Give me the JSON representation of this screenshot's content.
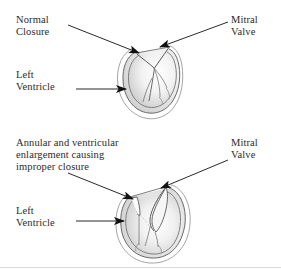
{
  "figure": {
    "width": 281,
    "height": 276,
    "background_color": "#ffffff",
    "ink_color": "#2b2b2b",
    "outline_color": "#555555",
    "shading_color": "#d9d9d9",
    "rule_color": "#d8d8d8"
  },
  "panels": {
    "normal": {
      "name": "normal-closure-panel",
      "labels": {
        "closure": "Normal\nClosure",
        "mitral_valve": "Mitral\nValve",
        "left_ventricle": "Left\nVentricle"
      },
      "annotations": {
        "closure_arrow": "arrow-pointing-down-right-to-valve",
        "mitral_valve_arrow": "arrow-pointing-down-left-to-valve",
        "left_ventricle_arrow": "arrow-pointing-right-to-ventricle-wall"
      },
      "anatomy": {
        "ventricle_shape": "narrow-oval-left-ventricle",
        "valve_state": "leaflets-coapted-closed",
        "chordae": "chordae-tendineae-strands"
      }
    },
    "regurgitant": {
      "name": "improper-closure-panel",
      "labels": {
        "closure": "Annular and ventricular\nenlargement causing\nimproper closure",
        "mitral_valve": "Mitral\nValve",
        "left_ventricle": "Left\nVentricle"
      },
      "annotations": {
        "closure_arrow": "arrow-pointing-down-right-to-posterior-leaflet",
        "mitral_valve_arrow": "arrow-pointing-down-left-to-anterior-leaflet",
        "left_ventricle_arrow": "arrow-pointing-right-to-ventricle-wall"
      },
      "anatomy": {
        "ventricle_shape": "dilated-rounded-left-ventricle",
        "valve_state": "leaflets-separated-regurgitant-gap",
        "chordae": "chordae-tendineae-strands"
      }
    }
  }
}
